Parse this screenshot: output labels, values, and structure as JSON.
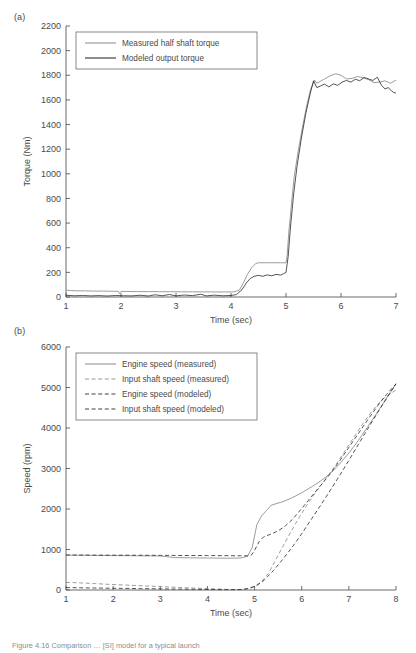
{
  "figure": {
    "caption": "Figure 4.16  Comparison … [SI] model for a typical launch",
    "panel_a_tag": "(a)",
    "panel_b_tag": "(b)"
  },
  "chart_data": [
    {
      "id": "panel-a",
      "type": "line",
      "title": "",
      "xlabel": "Time (sec)",
      "ylabel": "Torque (Nm)",
      "xlim": [
        1,
        7
      ],
      "ylim": [
        0,
        2200
      ],
      "xticks": [
        1,
        2,
        3,
        4,
        5,
        6,
        7
      ],
      "yticks": [
        0,
        200,
        400,
        600,
        800,
        1000,
        1200,
        1400,
        1600,
        1800,
        2000,
        2200
      ],
      "grid": false,
      "legend_position": "upper-left",
      "series": [
        {
          "name": "Measured half shaft torque",
          "style": "solid",
          "color": "#8a8a8a",
          "x": [
            1.0,
            1.1,
            1.2,
            1.35,
            1.5,
            1.65,
            1.8,
            1.95,
            1.97,
            2.0,
            2.1,
            2.3,
            2.5,
            2.7,
            2.9,
            3.1,
            3.3,
            3.5,
            3.7,
            3.9,
            4.05,
            4.15,
            4.22,
            4.3,
            4.38,
            4.45,
            4.5,
            4.7,
            4.9,
            5.0,
            5.02,
            5.05,
            5.1,
            5.15,
            5.22,
            5.3,
            5.38,
            5.45,
            5.52,
            5.56,
            5.6,
            5.7,
            5.8,
            5.9,
            6.0,
            6.1,
            6.2,
            6.3,
            6.4,
            6.5,
            6.6,
            6.7,
            6.8,
            6.9,
            7.0
          ],
          "y": [
            55,
            52,
            50,
            50,
            48,
            48,
            47,
            46,
            28,
            45,
            45,
            44,
            44,
            43,
            43,
            42,
            42,
            42,
            41,
            41,
            42,
            55,
            110,
            185,
            240,
            272,
            278,
            278,
            278,
            278,
            330,
            520,
            760,
            980,
            1180,
            1380,
            1560,
            1690,
            1760,
            1735,
            1745,
            1770,
            1795,
            1812,
            1800,
            1770,
            1775,
            1790,
            1780,
            1765,
            1740,
            1745,
            1755,
            1735,
            1760
          ]
        },
        {
          "name": "Modeled output torque",
          "style": "solid",
          "color": "#1c1c1c",
          "x": [
            1.0,
            1.15,
            1.3,
            1.45,
            1.6,
            1.75,
            1.9,
            2.05,
            2.2,
            2.35,
            2.5,
            2.62,
            2.75,
            2.88,
            3.0,
            3.15,
            3.3,
            3.45,
            3.55,
            3.7,
            3.85,
            4.0,
            4.1,
            4.2,
            4.28,
            4.35,
            4.42,
            4.5,
            4.58,
            4.66,
            4.74,
            4.82,
            4.9,
            4.96,
            5.0,
            5.04,
            5.08,
            5.14,
            5.2,
            5.28,
            5.36,
            5.44,
            5.5,
            5.56,
            5.62,
            5.7,
            5.78,
            5.86,
            5.94,
            6.02,
            6.1,
            6.18,
            6.26,
            6.34,
            6.42,
            6.5,
            6.58,
            6.66,
            6.74,
            6.8,
            6.86,
            6.92,
            6.96,
            7.0
          ],
          "y": [
            14,
            10,
            12,
            9,
            11,
            8,
            12,
            10,
            9,
            14,
            8,
            18,
            10,
            20,
            9,
            16,
            11,
            22,
            9,
            15,
            10,
            12,
            20,
            60,
            115,
            150,
            168,
            176,
            168,
            180,
            172,
            184,
            178,
            190,
            200,
            330,
            560,
            840,
            1060,
            1290,
            1490,
            1650,
            1755,
            1700,
            1712,
            1728,
            1706,
            1730,
            1718,
            1745,
            1758,
            1744,
            1768,
            1756,
            1782,
            1770,
            1758,
            1784,
            1716,
            1690,
            1700,
            1672,
            1660,
            1655
          ]
        }
      ]
    },
    {
      "id": "panel-b",
      "type": "line",
      "title": "",
      "xlabel": "Time (sec)",
      "ylabel": "Speed (rpm)",
      "xlim": [
        1,
        8
      ],
      "ylim": [
        0,
        6000
      ],
      "xticks": [
        1,
        2,
        3,
        4,
        5,
        6,
        7,
        8
      ],
      "yticks": [
        0,
        1000,
        2000,
        3000,
        4000,
        5000,
        6000
      ],
      "grid": false,
      "legend_position": "upper-left",
      "series": [
        {
          "name": "Engine speed (measured)",
          "style": "solid",
          "color": "#8a8a8a",
          "x": [
            1.0,
            1.5,
            2.0,
            2.5,
            3.0,
            3.3,
            3.6,
            4.0,
            4.4,
            4.7,
            4.85,
            4.95,
            5.05,
            5.15,
            5.25,
            5.35,
            5.45,
            5.6,
            5.8,
            6.0,
            6.2,
            6.4,
            6.6,
            6.8,
            7.0,
            7.2,
            7.4,
            7.6,
            7.8,
            8.0
          ],
          "y": [
            860,
            855,
            850,
            845,
            840,
            800,
            795,
            790,
            785,
            790,
            830,
            1050,
            1620,
            1830,
            1960,
            2090,
            2130,
            2180,
            2280,
            2400,
            2540,
            2690,
            2870,
            3110,
            3380,
            3690,
            4030,
            4380,
            4740,
            5090
          ]
        },
        {
          "name": "Input shaft speed (measured)",
          "style": "dashed",
          "color": "#8a8a8a",
          "x": [
            1.0,
            1.3,
            1.6,
            1.9,
            2.2,
            2.5,
            2.8,
            3.1,
            3.4,
            3.7,
            4.0,
            4.3,
            4.55,
            4.7,
            4.85,
            5.0,
            5.15,
            5.3,
            5.5,
            5.7,
            5.9,
            6.1,
            6.3,
            6.5,
            6.7,
            6.9,
            7.1,
            7.3,
            7.5,
            7.7,
            8.0
          ],
          "y": [
            190,
            175,
            160,
            140,
            125,
            110,
            95,
            80,
            62,
            48,
            35,
            20,
            8,
            12,
            35,
            95,
            210,
            420,
            860,
            1290,
            1700,
            2080,
            2420,
            2730,
            3050,
            3400,
            3760,
            4110,
            4430,
            4700,
            4940
          ]
        },
        {
          "name": "Engine speed (modeled)",
          "style": "dashed",
          "color": "#2a2a2a",
          "x": [
            1.0,
            1.5,
            2.0,
            2.5,
            3.0,
            3.5,
            4.0,
            4.4,
            4.7,
            4.86,
            4.94,
            5.0,
            5.1,
            5.2,
            5.35,
            5.5,
            5.65,
            5.8,
            6.0,
            6.2,
            6.4,
            6.6,
            6.8,
            7.0,
            7.2,
            7.4,
            7.6,
            7.8,
            8.0
          ],
          "y": [
            865,
            862,
            860,
            858,
            855,
            852,
            850,
            848,
            846,
            845,
            870,
            980,
            1200,
            1320,
            1380,
            1460,
            1580,
            1740,
            2010,
            2300,
            2580,
            2860,
            3180,
            3520,
            3860,
            4200,
            4530,
            4830,
            5090
          ]
        },
        {
          "name": "Input shaft speed (modeled)",
          "style": "dashed",
          "color": "#2a2a2a",
          "x": [
            1.0,
            1.4,
            1.8,
            2.2,
            2.6,
            3.0,
            3.4,
            3.8,
            4.2,
            4.5,
            4.75,
            4.9,
            5.05,
            5.2,
            5.4,
            5.6,
            5.8,
            6.0,
            6.2,
            6.4,
            6.6,
            6.8,
            7.0,
            7.2,
            7.4,
            7.6,
            7.8,
            8.0
          ],
          "y": [
            60,
            52,
            46,
            40,
            34,
            28,
            22,
            16,
            10,
            8,
            14,
            40,
            110,
            240,
            480,
            760,
            1060,
            1390,
            1740,
            2090,
            2450,
            2820,
            3200,
            3590,
            3980,
            4360,
            4730,
            5090
          ]
        }
      ]
    }
  ]
}
